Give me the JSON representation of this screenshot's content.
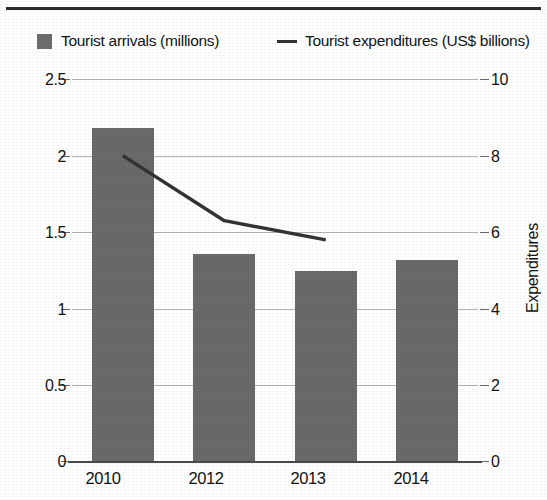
{
  "chart_data": {
    "type": "bar",
    "title": "",
    "subtitle": "",
    "categories": [
      "2010",
      "2012",
      "2013",
      "2014"
    ],
    "series": [
      {
        "name": "Tourist arrivals (millions)",
        "type": "bar",
        "axis": "left",
        "color": "#6a6a6a",
        "values": [
          2.18,
          1.36,
          1.25,
          1.32
        ]
      },
      {
        "name": "Tourist expenditures (US$ billions)",
        "type": "line",
        "axis": "right",
        "color": "#333333",
        "values": [
          8.0,
          6.3,
          5.8,
          null
        ]
      }
    ],
    "xlabel": "",
    "ylabel": "Arrivals",
    "y2label": "Expenditures",
    "ylim": [
      0,
      2.5
    ],
    "y2lim": [
      0,
      10
    ],
    "yticks": [
      "0",
      "0.5",
      "1",
      "1.5",
      "2",
      "2.5"
    ],
    "y2ticks": [
      "0",
      "2",
      "4",
      "6",
      "8",
      "10"
    ],
    "grid": true,
    "legend_position": "top"
  },
  "legend": {
    "arrivals": {
      "label": "Tourist arrivals (millions)",
      "marker": "filled-square-marker",
      "color": "#6d6d6d"
    },
    "expenditures": {
      "label": "Tourist expenditures (US$ billions)",
      "marker": "line-dash-marker",
      "color": "#333333"
    }
  },
  "axes": {
    "left": {
      "title": "Arrivals",
      "ticks": [
        "2.5",
        "2",
        "1.5",
        "1",
        "0.5",
        "0"
      ]
    },
    "right": {
      "title": "Expenditures",
      "ticks": [
        "10",
        "8",
        "6",
        "4",
        "2",
        "0"
      ]
    },
    "bottom": {
      "ticks": [
        "2010",
        "2012",
        "2013",
        "2014"
      ]
    }
  }
}
